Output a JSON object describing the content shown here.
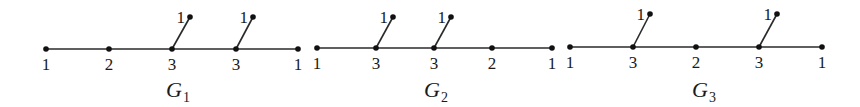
{
  "diagram": {
    "colors": {
      "ink": "#111111",
      "edge": "#2a2a2a",
      "background": "#ffffff"
    },
    "graphs": [
      {
        "name": "G",
        "subscript": "1",
        "label_pos": {
          "x": 166,
          "y": 97
        },
        "spine": [
          {
            "x": 46,
            "y": 49,
            "label": "1"
          },
          {
            "x": 109,
            "y": 49,
            "label": "2"
          },
          {
            "x": 172,
            "y": 49,
            "label": "3"
          },
          {
            "x": 236,
            "y": 49,
            "label": "3"
          },
          {
            "x": 298,
            "y": 49,
            "label": "1"
          }
        ],
        "pendants": [
          {
            "attach": 2,
            "x": 190,
            "y": 17,
            "label": "1"
          },
          {
            "attach": 3,
            "x": 253,
            "y": 17,
            "label": "1"
          }
        ]
      },
      {
        "name": "G",
        "subscript": "2",
        "label_pos": {
          "x": 424,
          "y": 97
        },
        "spine": [
          {
            "x": 317,
            "y": 48,
            "label": "1"
          },
          {
            "x": 376,
            "y": 48,
            "label": "3"
          },
          {
            "x": 434,
            "y": 48,
            "label": "3"
          },
          {
            "x": 492,
            "y": 48,
            "label": "2"
          },
          {
            "x": 552,
            "y": 48,
            "label": "1"
          }
        ],
        "pendants": [
          {
            "attach": 1,
            "x": 393,
            "y": 17,
            "label": "1"
          },
          {
            "attach": 2,
            "x": 451,
            "y": 17,
            "label": "1"
          }
        ]
      },
      {
        "name": "G",
        "subscript": "3",
        "label_pos": {
          "x": 692,
          "y": 97
        },
        "spine": [
          {
            "x": 570,
            "y": 47,
            "label": "1"
          },
          {
            "x": 633,
            "y": 47,
            "label": "3"
          },
          {
            "x": 696,
            "y": 47,
            "label": "2"
          },
          {
            "x": 759,
            "y": 47,
            "label": "3"
          },
          {
            "x": 822,
            "y": 47,
            "label": "1"
          }
        ],
        "pendants": [
          {
            "attach": 1,
            "x": 650,
            "y": 14,
            "label": "1"
          },
          {
            "attach": 3,
            "x": 777,
            "y": 14,
            "label": "1"
          }
        ]
      }
    ]
  }
}
